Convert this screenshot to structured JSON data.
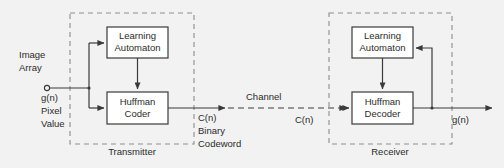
{
  "diagram": {
    "colors": {
      "background": "#f2f2f2",
      "box_stroke": "#3a3a3a",
      "group_stroke": "#8d8d8d",
      "wire": "#3a3a3a",
      "text": "#2b2b2b"
    },
    "transmitter": {
      "group_label": "Transmitter",
      "blocks": [
        {
          "id": "tx-learning-automaton",
          "line1": "Learning",
          "line2": "Automaton"
        },
        {
          "id": "tx-huffman-coder",
          "line1": "Huffman",
          "line2": "Coder"
        }
      ],
      "input_label": {
        "line1": "Image",
        "line2": "Array",
        "signal": "g(n)",
        "desc1": "Pixel",
        "desc2": "Value"
      },
      "output_label": {
        "signal": "C(n)",
        "desc1": "Binary",
        "desc2": "Codeword"
      }
    },
    "channel": {
      "label": "Channel",
      "signal_in": "C(n)",
      "signal_out": "C(n)"
    },
    "receiver": {
      "group_label": "Receiver",
      "blocks": [
        {
          "id": "rx-learning-automaton",
          "line1": "Learning",
          "line2": "Automaton"
        },
        {
          "id": "rx-huffman-decoder",
          "line1": "Huffman",
          "line2": "Decoder"
        }
      ],
      "input_label": {
        "signal": "C(n)"
      },
      "output_label": {
        "signal": "g(n)"
      }
    }
  }
}
